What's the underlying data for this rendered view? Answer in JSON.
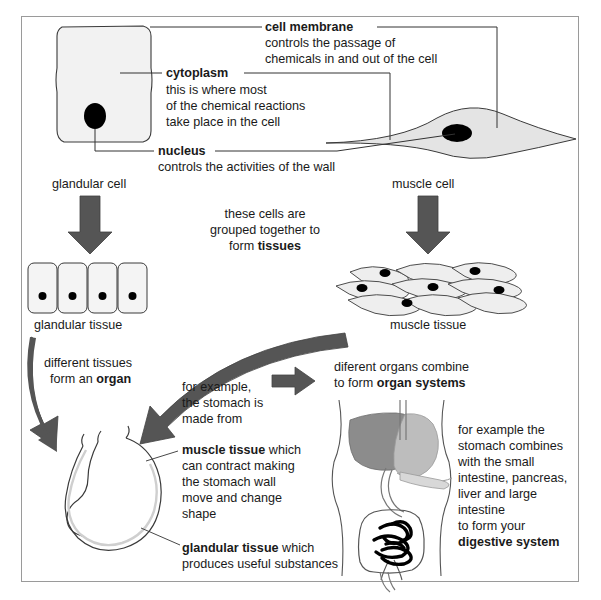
{
  "diagram": {
    "colors": {
      "arrow_gray": "#555555",
      "cell_fill": "#f2f2f2",
      "nucleus": "#000000",
      "liver": "#8c8c8c",
      "stomach_organ": "#bdbdbd",
      "frame_border": "#9a9a9a",
      "text": "#1a1a1a",
      "leader_line": "#333333"
    },
    "labels": {
      "cell_membrane": {
        "term": "cell membrane",
        "line1": "controls the passage of",
        "line2": "chemicals in and out of the cell"
      },
      "cytoplasm": {
        "term": "cytoplasm",
        "line1": "this is where most",
        "line2": "of the chemical reactions",
        "line3": "take place in the cell"
      },
      "nucleus": {
        "term": "nucleus",
        "line1": "controls the activities of the wall"
      },
      "glandular_cell": "glandular cell",
      "muscle_cell": "muscle cell",
      "glandular_tissue": "glandular tissue",
      "muscle_tissue": "muscle tissue"
    },
    "notes": {
      "tissues": {
        "line1": "these cells are",
        "line2": "grouped together to",
        "line3_plain": "form ",
        "line3_bold": "tissues"
      },
      "organ": {
        "line1": "different tissues",
        "line2_plain": "form an ",
        "line2_bold": "organ"
      },
      "stomach_example": {
        "line1": "for example,",
        "line2": "the stomach is",
        "line3": "made from"
      },
      "organ_systems": {
        "line1": "diferent organs combine",
        "line2_plain": "to form ",
        "line2_bold": "organ systems"
      },
      "muscle_tissue_detail": {
        "bold": "muscle tissue",
        "rest": " which",
        "line2": "can contract making",
        "line3": "the stomach wall",
        "line4": "move and change",
        "line5": "shape"
      },
      "glandular_tissue_detail": {
        "bold": "glandular tissue",
        "rest": " which",
        "line2": "produces useful substances"
      },
      "digestive_system": {
        "line1": "for example the",
        "line2": "stomach combines",
        "line3": "with the small",
        "line4": "intestine, pancreas,",
        "line5": "liver and large",
        "line6": "intestine",
        "line7": "to form your",
        "line8_bold": "digestive system"
      }
    }
  }
}
